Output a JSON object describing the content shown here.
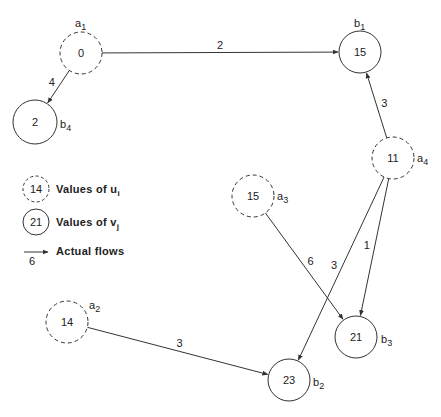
{
  "diagram": {
    "type": "transportation-network",
    "nodes": [
      {
        "id": "a1",
        "kind": "u",
        "value": "0",
        "label": "a",
        "sub": "1",
        "cx": 81,
        "cy": 53,
        "r": 21
      },
      {
        "id": "a2",
        "kind": "u",
        "value": "14",
        "label": "a",
        "sub": "2",
        "cx": 67,
        "cy": 322,
        "r": 21
      },
      {
        "id": "a3",
        "kind": "u",
        "value": "15",
        "label": "a",
        "sub": "3",
        "cx": 253,
        "cy": 196,
        "r": 21
      },
      {
        "id": "a4",
        "kind": "u",
        "value": "11",
        "label": "a",
        "sub": "4",
        "cx": 393,
        "cy": 158,
        "r": 21
      },
      {
        "id": "b1",
        "kind": "v",
        "value": "15",
        "label": "b",
        "sub": "1",
        "cx": 360,
        "cy": 52,
        "r": 21
      },
      {
        "id": "b2",
        "kind": "v",
        "value": "23",
        "label": "b",
        "sub": "2",
        "cx": 289,
        "cy": 380,
        "r": 21
      },
      {
        "id": "b3",
        "kind": "v",
        "value": "21",
        "label": "b",
        "sub": "3",
        "cx": 356,
        "cy": 337,
        "r": 21
      },
      {
        "id": "b4",
        "kind": "v",
        "value": "2",
        "label": "b",
        "sub": "4",
        "cx": 35,
        "cy": 122,
        "r": 22
      }
    ],
    "edges": [
      {
        "from": "a1",
        "to": "b1",
        "flow": "2"
      },
      {
        "from": "a1",
        "to": "b4",
        "flow": "4"
      },
      {
        "from": "a4",
        "to": "b1",
        "flow": "3"
      },
      {
        "from": "a4",
        "to": "b2",
        "flow": "3"
      },
      {
        "from": "a4",
        "to": "b3",
        "flow": "1"
      },
      {
        "from": "a3",
        "to": "b3",
        "flow": "6"
      },
      {
        "from": "a2",
        "to": "b2",
        "flow": "3"
      }
    ]
  },
  "legend": {
    "u_sample": "14",
    "u_text": "Values of u",
    "u_sub": "i",
    "v_sample": "21",
    "v_text": "Values of v",
    "v_sub": "j",
    "flow_sample": "6",
    "flow_text": "Actual flows"
  },
  "colors": {
    "stroke": "#333333",
    "text": "#222222",
    "background": "#ffffff"
  }
}
